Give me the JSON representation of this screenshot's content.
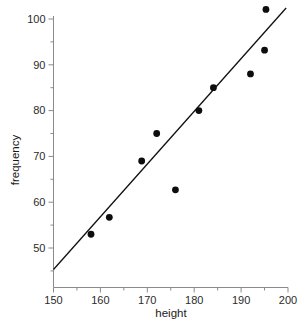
{
  "chart_data": {
    "type": "scatter",
    "title": "",
    "xlabel": "height",
    "ylabel": "frequency",
    "xlim": [
      150,
      200
    ],
    "ylim": [
      45,
      103
    ],
    "x_ticks": [
      150,
      160,
      170,
      180,
      190,
      200
    ],
    "y_ticks": [
      50,
      60,
      70,
      80,
      90,
      100
    ],
    "x_tick_labels": [
      "150",
      "160",
      "170",
      "180",
      "190",
      "200"
    ],
    "y_tick_labels": [
      "50",
      "60",
      "70",
      "80",
      "90",
      "100"
    ],
    "x_minor_step": 5,
    "y_minor_step": 5,
    "grid": false,
    "legend": null,
    "points": [
      {
        "x": 158.0,
        "y": 53.0
      },
      {
        "x": 161.9,
        "y": 56.7
      },
      {
        "x": 168.8,
        "y": 69.0
      },
      {
        "x": 172.0,
        "y": 75.0
      },
      {
        "x": 176.0,
        "y": 62.7
      },
      {
        "x": 181.0,
        "y": 80.0
      },
      {
        "x": 184.1,
        "y": 85.0
      },
      {
        "x": 192.0,
        "y": 88.0
      },
      {
        "x": 195.0,
        "y": 93.2
      },
      {
        "x": 195.3,
        "y": 102.1
      }
    ],
    "trendline": {
      "type": "linear-fit",
      "x0": 150.0,
      "y0": 45.3,
      "x1": 199.6,
      "y1": 102.4
    },
    "marker": {
      "shape": "circle",
      "radius_px": 3.4,
      "color": "#0d0d0d"
    },
    "colors": {
      "axis": "#8a8a8a",
      "text": "#1a1a1a",
      "line": "#111111",
      "background": "#ffffff"
    }
  }
}
